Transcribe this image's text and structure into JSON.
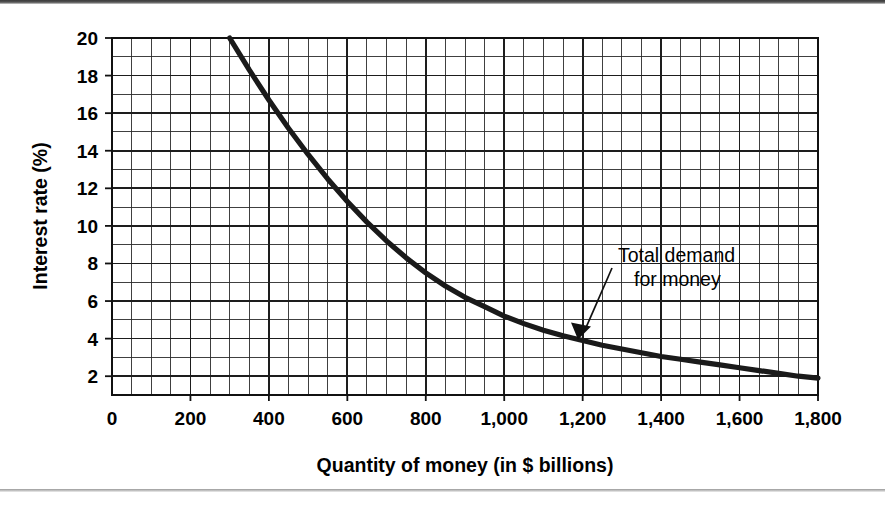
{
  "figure": {
    "background_color": "#ffffff",
    "line_color": "#1a1a1a",
    "grid_color": "#2b2b2b",
    "top_rule_color": "#3a3a3a",
    "bottom_rule_color": "#9a9a9a"
  },
  "chart_data": {
    "type": "line",
    "title": "",
    "subtitle": "",
    "xlabel": "Quantity of money (in $ billions)",
    "ylabel": "Interest rate (%)",
    "xlim": [
      0,
      1800
    ],
    "ylim": [
      1,
      20
    ],
    "grid": true,
    "grid_major_x": 200,
    "grid_minor_x": 50,
    "grid_major_y": 2,
    "grid_minor_y": 1,
    "legend_position": "none",
    "xticks": [
      0,
      200,
      400,
      600,
      800,
      1000,
      1200,
      1400,
      1600,
      1800
    ],
    "xticklabels": [
      "0",
      "200",
      "400",
      "600",
      "800",
      "1,000",
      "1,200",
      "1,400",
      "1,600",
      "1,800"
    ],
    "yticks": [
      2,
      4,
      6,
      8,
      10,
      12,
      14,
      16,
      18,
      20
    ],
    "yticklabels": [
      "2",
      "4",
      "6",
      "8",
      "10",
      "12",
      "14",
      "16",
      "18",
      "20"
    ],
    "series": [
      {
        "name": "Total demand for money",
        "x": [
          300,
          350,
          400,
          450,
          500,
          550,
          600,
          650,
          700,
          750,
          800,
          850,
          900,
          950,
          1000,
          1050,
          1100,
          1150,
          1200,
          1250,
          1300,
          1350,
          1400,
          1450,
          1500,
          1550,
          1600,
          1650,
          1700,
          1750,
          1800
        ],
        "y": [
          20.0,
          18.3,
          16.7,
          15.2,
          13.8,
          12.5,
          11.3,
          10.2,
          9.2,
          8.3,
          7.5,
          6.8,
          6.2,
          5.7,
          5.2,
          4.8,
          4.45,
          4.15,
          3.9,
          3.65,
          3.45,
          3.25,
          3.05,
          2.9,
          2.75,
          2.6,
          2.45,
          2.3,
          2.15,
          2.0,
          1.9
        ]
      }
    ],
    "annotations": [
      {
        "text_line1": "Total demand",
        "text_line2": "for money",
        "label_x": 1290,
        "label_y": 8.4,
        "arrow_target_x": 1188,
        "arrow_target_y": 3.95
      }
    ]
  }
}
